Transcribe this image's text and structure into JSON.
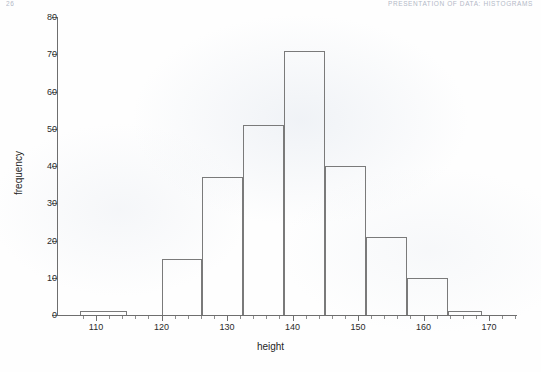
{
  "page": {
    "running_head_left": "26",
    "running_head_right": "PRESENTATION OF DATA: HISTOGRAMS"
  },
  "chart_data": {
    "type": "bar",
    "subtype": "histogram",
    "title": "",
    "xlabel": "height",
    "ylabel": "frequency",
    "xlim": [
      107.5,
      176
    ],
    "ylim": [
      0,
      80
    ],
    "grid": false,
    "legend": null,
    "bin_width": 6.25,
    "x_major_ticks": [
      110,
      120,
      130,
      140,
      150,
      160,
      170
    ],
    "x_minor_tick_step": 2,
    "y_major_ticks": [
      0,
      10,
      20,
      30,
      40,
      50,
      60,
      70,
      80
    ],
    "bins": [
      {
        "start": 107.5,
        "end": 114.75,
        "value": 1
      },
      {
        "start": 120.0,
        "end": 126.25,
        "value": 15
      },
      {
        "start": 126.25,
        "end": 132.5,
        "value": 37
      },
      {
        "start": 132.5,
        "end": 138.75,
        "value": 51
      },
      {
        "start": 138.75,
        "end": 145.0,
        "value": 71
      },
      {
        "start": 145.0,
        "end": 151.25,
        "value": 40
      },
      {
        "start": 151.25,
        "end": 157.5,
        "value": 21
      },
      {
        "start": 157.5,
        "end": 163.75,
        "value": 10
      },
      {
        "start": 163.75,
        "end": 169.0,
        "value": 1
      }
    ],
    "categories": [
      "107.5-114.8",
      "120.0-126.3",
      "126.3-132.5",
      "132.5-138.8",
      "138.8-145.0",
      "145.0-151.3",
      "151.3-157.5",
      "157.5-163.8",
      "163.8-169.0"
    ],
    "values": [
      1,
      15,
      37,
      51,
      71,
      40,
      21,
      10,
      1
    ],
    "colors": {
      "bar_outline": "#7a7a7a",
      "bar_fill": "transparent",
      "axis": "#6e6e6e",
      "text": "#1f1f1f"
    }
  }
}
